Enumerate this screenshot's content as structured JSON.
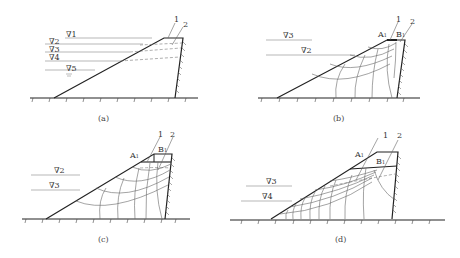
{
  "panels": [
    {
      "id": "a",
      "caption": "(a)",
      "labels": {
        "line1": "1",
        "line2": "2"
      },
      "water_levels": [
        "∇1",
        "∇2",
        "∇3",
        "∇4",
        "∇5"
      ]
    },
    {
      "id": "b",
      "caption": "(b)",
      "labels": {
        "line1": "1",
        "line2": "2",
        "pointA": "A",
        "pointA_sub": "1",
        "pointB": "B",
        "pointB_sub": "1"
      },
      "water_levels": [
        "∇3",
        "∇2"
      ]
    },
    {
      "id": "c",
      "caption": "(c)",
      "labels": {
        "line1": "1",
        "line2": "2",
        "pointA": "A",
        "pointA_sub": "1",
        "pointB": "B",
        "pointB_sub": "1"
      },
      "water_levels": [
        "∇2",
        "∇3"
      ]
    },
    {
      "id": "d",
      "caption": "(d)",
      "labels": {
        "line1": "1",
        "line2": "2",
        "pointA": "A",
        "pointA_sub": "1",
        "pointB": "B",
        "pointB_sub": "1"
      },
      "water_levels": [
        "∇3",
        "∇4"
      ]
    }
  ]
}
